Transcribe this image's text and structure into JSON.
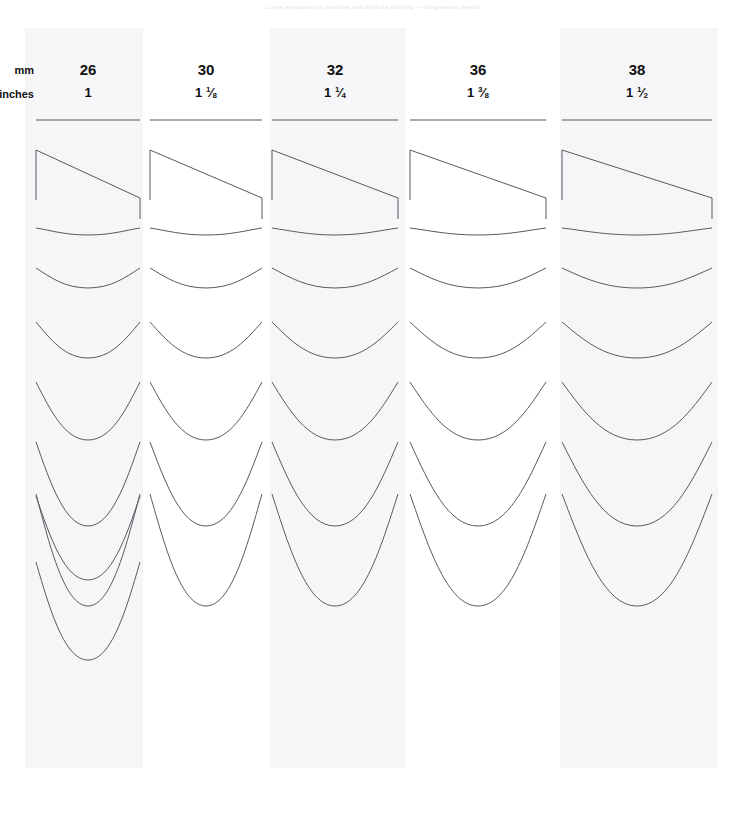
{
  "caption": {
    "text": "Curve templates for neckline and armhole shaping — progressive depths"
  },
  "table": {
    "row_labels": {
      "mm": "mm",
      "inches": "inches"
    },
    "columns": [
      {
        "id": "col-26",
        "mm": "26",
        "inches_whole": "1",
        "inches_num": "",
        "inches_den": "",
        "x_left": 36,
        "x_right": 140,
        "band_shaded": true,
        "band_left": 25,
        "band_width": 118,
        "row_count": 10
      },
      {
        "id": "col-30",
        "mm": "30",
        "inches_whole": "1",
        "inches_num": "1",
        "inches_den": "8",
        "x_left": 150,
        "x_right": 262,
        "band_shaded": false,
        "band_left": 148,
        "band_width": 122,
        "row_count": 8
      },
      {
        "id": "col-32",
        "mm": "32",
        "inches_whole": "1",
        "inches_num": "1",
        "inches_den": "4",
        "x_left": 272,
        "x_right": 398,
        "band_shaded": true,
        "band_left": 270,
        "band_width": 136,
        "row_count": 8
      },
      {
        "id": "col-36",
        "mm": "36",
        "inches_whole": "1",
        "inches_num": "3",
        "inches_den": "8",
        "x_left": 410,
        "x_right": 546,
        "band_shaded": false,
        "band_left": 408,
        "band_width": 148,
        "row_count": 8
      },
      {
        "id": "col-38",
        "mm": "38",
        "inches_whole": "1",
        "inches_num": "1",
        "inches_den": "2",
        "x_left": 562,
        "x_right": 712,
        "band_shaded": true,
        "band_left": 560,
        "band_width": 158,
        "row_count": 8
      }
    ],
    "rows": [
      {
        "index": 0,
        "kind": "straight",
        "y_top": 120,
        "depth": 0,
        "stub": 0
      },
      {
        "index": 1,
        "kind": "diagonal",
        "y_top": 150,
        "depth": 48,
        "stub": 50
      },
      {
        "index": 2,
        "kind": "curve",
        "y_top": 228,
        "depth": 7,
        "stub": 0
      },
      {
        "index": 3,
        "kind": "curve",
        "y_top": 272,
        "depth": 16,
        "stub": 4
      },
      {
        "index": 4,
        "kind": "curve",
        "y_top": 330,
        "depth": 28,
        "stub": 8
      },
      {
        "index": 5,
        "kind": "curve",
        "y_top": 396,
        "depth": 44,
        "stub": 14
      },
      {
        "index": 6,
        "kind": "curve",
        "y_top": 462,
        "depth": 64,
        "stub": 20
      },
      {
        "index": 7,
        "kind": "curve",
        "y_top": 520,
        "depth": 86,
        "stub": 26
      },
      {
        "index": 8,
        "kind": "curve",
        "y_top": 518,
        "depth": 62,
        "stub": 22
      },
      {
        "index": 9,
        "kind": "curve",
        "y_top": 588,
        "depth": 72,
        "stub": 26
      }
    ],
    "colors": {
      "stroke": "#59595e",
      "band": "#f6f6f8",
      "page": "#ffffff",
      "text": "#111111"
    }
  }
}
